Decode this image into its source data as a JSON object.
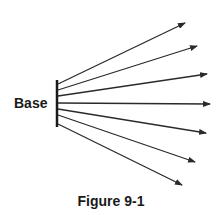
{
  "figure": {
    "base_label": "Base",
    "caption": "Figure 9-1",
    "colors": {
      "line": "#2a2a2a",
      "text": "#1a1a1a",
      "background": "#ffffff"
    },
    "base_bar": {
      "x": 57,
      "y1": 80,
      "y2": 127
    },
    "arrows": [
      {
        "x1": 58,
        "y1": 84,
        "x2": 185,
        "y2": 23
      },
      {
        "x1": 58,
        "y1": 90,
        "x2": 197,
        "y2": 46
      },
      {
        "x1": 58,
        "y1": 96,
        "x2": 207,
        "y2": 74
      },
      {
        "x1": 58,
        "y1": 103,
        "x2": 210,
        "y2": 104
      },
      {
        "x1": 58,
        "y1": 109,
        "x2": 206,
        "y2": 133
      },
      {
        "x1": 58,
        "y1": 115,
        "x2": 195,
        "y2": 162
      },
      {
        "x1": 58,
        "y1": 124,
        "x2": 182,
        "y2": 185
      }
    ]
  }
}
